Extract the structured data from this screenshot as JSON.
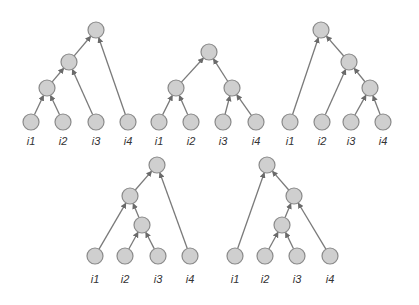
{
  "diagram": {
    "title": "",
    "node_radius": 8,
    "colors": {
      "node_fill": "#cfcfcf",
      "node_stroke": "#8a8a8a",
      "edge": "#7a7a7a",
      "label": "#333333"
    },
    "trees": [
      {
        "name": "tree-1",
        "nodes": [
          {
            "id": "l1",
            "x": 31,
            "y": 122,
            "label": "i1"
          },
          {
            "id": "l2",
            "x": 63,
            "y": 122,
            "label": "i2"
          },
          {
            "id": "l3",
            "x": 96,
            "y": 122,
            "label": "i3"
          },
          {
            "id": "l4",
            "x": 128,
            "y": 122,
            "label": "i4"
          },
          {
            "id": "a",
            "x": 47,
            "y": 88
          },
          {
            "id": "b",
            "x": 69,
            "y": 62
          },
          {
            "id": "r",
            "x": 96,
            "y": 30
          }
        ],
        "edges": [
          [
            "l1",
            "a"
          ],
          [
            "l2",
            "a"
          ],
          [
            "a",
            "b"
          ],
          [
            "l3",
            "b"
          ],
          [
            "b",
            "r"
          ],
          [
            "l4",
            "r"
          ]
        ],
        "label_y": 145
      },
      {
        "name": "tree-2",
        "nodes": [
          {
            "id": "l1",
            "x": 159,
            "y": 122,
            "label": "i1"
          },
          {
            "id": "l2",
            "x": 191,
            "y": 122,
            "label": "i2"
          },
          {
            "id": "l3",
            "x": 223,
            "y": 122,
            "label": "i3"
          },
          {
            "id": "l4",
            "x": 256,
            "y": 122,
            "label": "i4"
          },
          {
            "id": "a",
            "x": 176,
            "y": 88
          },
          {
            "id": "b",
            "x": 232,
            "y": 88
          },
          {
            "id": "r",
            "x": 209,
            "y": 52
          }
        ],
        "edges": [
          [
            "l1",
            "a"
          ],
          [
            "l2",
            "a"
          ],
          [
            "l3",
            "b"
          ],
          [
            "l4",
            "b"
          ],
          [
            "a",
            "r"
          ],
          [
            "b",
            "r"
          ]
        ],
        "label_y": 145
      },
      {
        "name": "tree-3",
        "nodes": [
          {
            "id": "l1",
            "x": 290,
            "y": 122,
            "label": "i1"
          },
          {
            "id": "l2",
            "x": 322,
            "y": 122,
            "label": "i2"
          },
          {
            "id": "l3",
            "x": 351,
            "y": 122,
            "label": "i3"
          },
          {
            "id": "l4",
            "x": 383,
            "y": 122,
            "label": "i4"
          },
          {
            "id": "a",
            "x": 370,
            "y": 88
          },
          {
            "id": "b",
            "x": 349,
            "y": 62
          },
          {
            "id": "r",
            "x": 321,
            "y": 30
          }
        ],
        "edges": [
          [
            "l3",
            "a"
          ],
          [
            "l4",
            "a"
          ],
          [
            "a",
            "b"
          ],
          [
            "l2",
            "b"
          ],
          [
            "b",
            "r"
          ],
          [
            "l1",
            "r"
          ]
        ],
        "label_y": 145
      },
      {
        "name": "tree-4",
        "nodes": [
          {
            "id": "l1",
            "x": 95,
            "y": 256,
            "label": "i1"
          },
          {
            "id": "l2",
            "x": 125,
            "y": 256,
            "label": "i2"
          },
          {
            "id": "l3",
            "x": 158,
            "y": 256,
            "label": "i3"
          },
          {
            "id": "l4",
            "x": 190,
            "y": 256,
            "label": "i4"
          },
          {
            "id": "a",
            "x": 142,
            "y": 225
          },
          {
            "id": "b",
            "x": 130,
            "y": 196
          },
          {
            "id": "r",
            "x": 157,
            "y": 165
          }
        ],
        "edges": [
          [
            "l2",
            "a"
          ],
          [
            "l3",
            "a"
          ],
          [
            "a",
            "b"
          ],
          [
            "l1",
            "b"
          ],
          [
            "b",
            "r"
          ],
          [
            "l4",
            "r"
          ]
        ],
        "label_y": 283
      },
      {
        "name": "tree-5",
        "nodes": [
          {
            "id": "l1",
            "x": 235,
            "y": 256,
            "label": "i1"
          },
          {
            "id": "l2",
            "x": 265,
            "y": 256,
            "label": "i2"
          },
          {
            "id": "l3",
            "x": 297,
            "y": 256,
            "label": "i3"
          },
          {
            "id": "l4",
            "x": 330,
            "y": 256,
            "label": "i4"
          },
          {
            "id": "a",
            "x": 282,
            "y": 225
          },
          {
            "id": "b",
            "x": 294,
            "y": 196
          },
          {
            "id": "r",
            "x": 267,
            "y": 165
          }
        ],
        "edges": [
          [
            "l2",
            "a"
          ],
          [
            "l3",
            "a"
          ],
          [
            "a",
            "b"
          ],
          [
            "l4",
            "b"
          ],
          [
            "b",
            "r"
          ],
          [
            "l1",
            "r"
          ]
        ],
        "label_y": 283
      }
    ]
  }
}
